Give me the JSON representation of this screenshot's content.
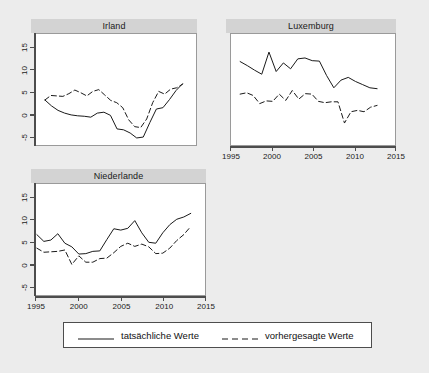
{
  "figure": {
    "background_color": "#ececec",
    "panel_background_color": "#ffffff",
    "panel_header_color": "#d3d3d3",
    "line_color": "#1a1a1a"
  },
  "legend": {
    "entries": [
      {
        "label": "tatsächliche Werte",
        "style": "solid",
        "series_key": "actual"
      },
      {
        "label": "vorhergesagte Werte",
        "style": "dashed",
        "series_key": "predicted"
      }
    ]
  },
  "chart_data": {
    "type": "line",
    "title": "",
    "xlabel": "",
    "ylabel": "",
    "xlim": [
      1995,
      2015
    ],
    "ylim": [
      -7.5,
      17.5
    ],
    "xticks": [
      1995,
      2000,
      2005,
      2010,
      2015
    ],
    "yticks": [
      -5,
      0,
      5,
      10,
      15
    ],
    "xtick_labels": [
      "1995",
      "2000",
      "2005",
      "2010",
      "2015"
    ],
    "ytick_labels": [
      "-5",
      "0",
      "5",
      "10",
      "15"
    ],
    "grid": false,
    "legend_position": "bottom",
    "panels": [
      {
        "title": "Irland",
        "x": [
          1996,
          1997,
          1998,
          1999,
          2000,
          2001,
          2002,
          2003,
          2004,
          2005,
          2006,
          2007,
          2008,
          2009,
          2010,
          2011,
          2012,
          2013
        ],
        "series": [
          {
            "name": "tatsächliche Werte",
            "key": "actual",
            "style": "solid",
            "values": [
              2.9,
              1.6,
              0.6,
              0.0,
              -0.4,
              -0.6,
              -0.7,
              -0.9,
              0.0,
              0.2,
              -0.5,
              -3.5,
              -3.7,
              -4.4,
              -5.5,
              -5.3,
              -2.1,
              0.9,
              1.2,
              3.0,
              5.0,
              6.5
            ]
          },
          {
            "name": "vorhergesagte Werte",
            "key": "predicted",
            "style": "dashed",
            "values": [
              2.9,
              3.9,
              3.8,
              3.7,
              4.3,
              5.1,
              4.5,
              3.8,
              4.8,
              5.2,
              4.0,
              2.8,
              2.3,
              1.2,
              -1.5,
              -3.0,
              -3.2,
              -1.3,
              2.3,
              4.8,
              4.2,
              5.3,
              5.6,
              6.4
            ]
          }
        ]
      },
      {
        "title": "Luxemburg",
        "x": [
          1996,
          1997,
          1998,
          1999,
          2000,
          2001,
          2002,
          2003,
          2004,
          2005,
          2006,
          2007,
          2008,
          2009,
          2010,
          2011,
          2012,
          2013
        ],
        "series": [
          {
            "name": "tatsächliche Werte",
            "key": "actual",
            "style": "solid",
            "values": [
              11.4,
              10.5,
              9.5,
              8.6,
              13.5,
              9.2,
              11.1,
              9.8,
              12.0,
              12.2,
              11.6,
              11.5,
              8.3,
              5.6,
              7.3,
              7.9,
              7.0,
              6.3,
              5.6,
              5.4
            ]
          },
          {
            "name": "vorhergesagte Werte",
            "key": "predicted",
            "style": "dashed",
            "values": [
              4.2,
              4.5,
              3.9,
              2.1,
              2.7,
              2.6,
              4.2,
              2.8,
              5.0,
              3.1,
              4.3,
              4.2,
              2.6,
              2.3,
              2.5,
              2.5,
              -2.2,
              0.3,
              0.6,
              0.3,
              1.3,
              1.7
            ]
          }
        ]
      },
      {
        "title": "Niederlande",
        "x": [
          1995,
          1996,
          1997,
          1998,
          1999,
          2000,
          2001,
          2002,
          2003,
          2004,
          2005,
          2006,
          2007,
          2008,
          2009,
          2010,
          2011,
          2012,
          2013
        ],
        "series": [
          {
            "name": "tatsächliche Werte",
            "key": "actual",
            "style": "solid",
            "values": [
              6.3,
              4.8,
              5.1,
              6.5,
              4.4,
              3.6,
              2.0,
              2.1,
              2.6,
              2.7,
              5.2,
              7.6,
              7.3,
              7.7,
              9.4,
              6.7,
              4.6,
              4.4,
              6.7,
              8.5,
              9.7,
              10.2,
              11.0
            ]
          },
          {
            "name": "vorhergesagte Werte",
            "key": "predicted",
            "style": "dashed",
            "values": [
              3.3,
              2.4,
              2.5,
              2.6,
              2.9,
              -0.3,
              1.6,
              0.2,
              0.2,
              1.0,
              1.1,
              2.3,
              3.7,
              4.4,
              3.7,
              4.2,
              3.6,
              2.1,
              2.2,
              3.3,
              5.0,
              6.3,
              8.1
            ]
          }
        ]
      }
    ]
  }
}
